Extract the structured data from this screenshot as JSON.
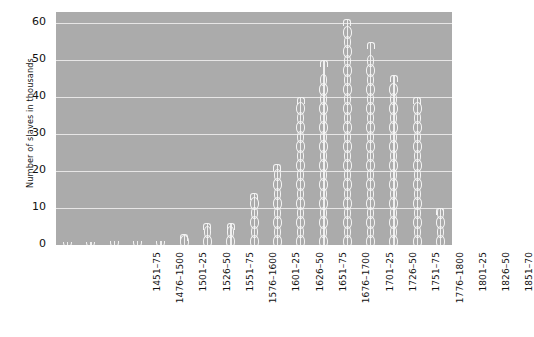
{
  "chart_data": {
    "type": "bar",
    "title": "",
    "xlabel": "",
    "ylabel": "Number of slaves in thousands",
    "ylim": [
      0,
      63
    ],
    "yticks": [
      0,
      10,
      20,
      30,
      40,
      50,
      60
    ],
    "grid": true,
    "legend": "none",
    "bar_style": "chain-link",
    "categories": [
      "1451–75",
      "1476–1500",
      "1501–25",
      "1526–50",
      "1551–75",
      "1576–1600",
      "1601–25",
      "1626–50",
      "1651–75",
      "1676–1700",
      "1701–25",
      "1726–50",
      "1751–75",
      "1776–1800",
      "1801–25",
      "1826–50",
      "1851–70"
    ],
    "values": [
      0.5,
      0.5,
      1,
      1,
      1,
      3,
      6,
      6,
      14,
      22,
      40,
      50,
      61,
      55,
      46,
      40,
      10
    ]
  },
  "colors": {
    "plot_background": "#ababab",
    "gridline": "#eceaea",
    "bar": "#f4f4f4",
    "text": "#111111",
    "page_background": "#ffffff"
  }
}
